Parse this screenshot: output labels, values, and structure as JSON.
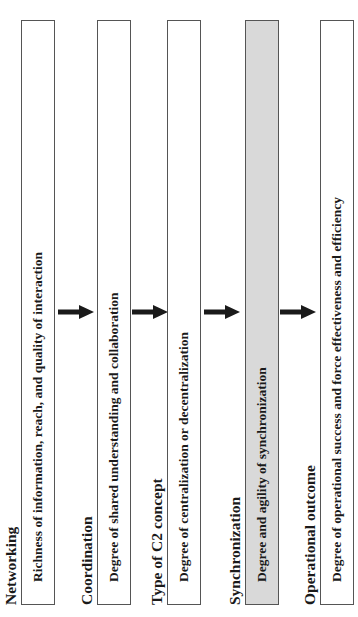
{
  "diagram": {
    "orientation": "rotated-90-ccw",
    "stages": [
      {
        "title": "Networking",
        "description": "Richness of information, reach, and quality of interaction",
        "highlighted": false
      },
      {
        "title": "Coordination",
        "description": "Degree of shared understanding and collaboration",
        "highlighted": false
      },
      {
        "title": "Type of C2 concept",
        "description": "Degree of centralization or decentralization",
        "highlighted": false
      },
      {
        "title": "Synchronization",
        "description": "Degree and agility of synchronization",
        "highlighted": true
      },
      {
        "title": "Operational outcome",
        "description": "Degree of operational success and force effectiveness and efficiency",
        "highlighted": false
      }
    ],
    "arrows": [
      {
        "from": 0,
        "to": 1
      },
      {
        "from": 1,
        "to": 2
      },
      {
        "from": 2,
        "to": 3
      },
      {
        "from": 3,
        "to": 4
      }
    ],
    "colors": {
      "box_border": "#555555",
      "box_fill": "#ffffff",
      "highlight_fill": "#d9d9d9",
      "text": "#1a1a1a",
      "arrow": "#1a1a1a"
    }
  }
}
